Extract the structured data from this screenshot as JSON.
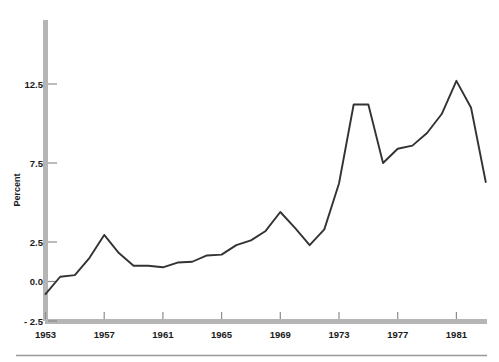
{
  "chart_data": {
    "type": "line",
    "title": "",
    "subtitle": "",
    "xlabel": "",
    "ylabel": "Percent",
    "xlim": [
      1953,
      1983
    ],
    "ylim": [
      -2.5,
      14.5
    ],
    "grid": false,
    "legend": null,
    "x_ticks": [
      1953,
      1957,
      1961,
      1965,
      1969,
      1973,
      1977,
      1981
    ],
    "x_tick_labels": [
      "1953",
      "1957",
      "1961",
      "1965",
      "1969",
      "1973",
      "1977",
      "1981"
    ],
    "y_ticks": [
      -2.5,
      0.0,
      2.5,
      7.5,
      12.5
    ],
    "y_tick_labels": [
      "- 2.5",
      "0.0",
      "2.5",
      "7.5",
      "12.5"
    ],
    "series": [
      {
        "name": "Percent",
        "color": "#333333",
        "x": [
          1953,
          1954,
          1955,
          1956,
          1957,
          1958,
          1959,
          1960,
          1961,
          1962,
          1963,
          1964,
          1965,
          1966,
          1967,
          1968,
          1969,
          1970,
          1971,
          1972,
          1973,
          1974,
          1975,
          1976,
          1977,
          1978,
          1979,
          1980,
          1981,
          1982,
          1983
        ],
        "y": [
          -0.8,
          0.3,
          0.4,
          1.5,
          2.95,
          1.8,
          1.0,
          1.0,
          0.9,
          1.2,
          1.25,
          1.65,
          1.7,
          2.3,
          2.6,
          3.2,
          4.4,
          3.4,
          2.3,
          3.3,
          6.2,
          11.2,
          11.2,
          7.5,
          8.4,
          8.6,
          9.4,
          10.6,
          12.7,
          11.0,
          6.3
        ]
      }
    ],
    "y_axis_spine_color": "#b0b0b0",
    "x_axis_spine_color": "#b0b0b0",
    "line_color": "#333333",
    "separator_rule_color": "#999999"
  },
  "axes": {
    "y_axis_title": "Percent"
  }
}
